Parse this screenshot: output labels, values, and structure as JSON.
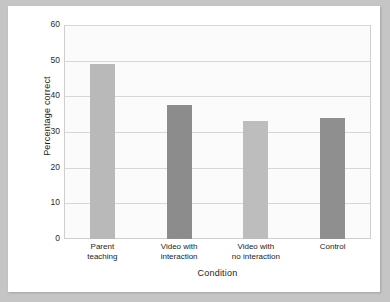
{
  "chart_data": {
    "type": "bar",
    "title": "",
    "xlabel": "Condition",
    "ylabel": "Percentage correct",
    "categories": [
      "Parent teaching",
      "Video with interaction",
      "Video with no interaction",
      "Control"
    ],
    "category_lines": [
      [
        "Parent",
        "teaching"
      ],
      [
        "Video with",
        "interaction"
      ],
      [
        "Video with",
        "no interaction"
      ],
      [
        "Control",
        ""
      ]
    ],
    "values": [
      49,
      37.5,
      33,
      34
    ],
    "ylim": [
      0,
      60
    ],
    "yticks": [
      0,
      10,
      20,
      30,
      40,
      50,
      60
    ],
    "ytick_labels": [
      "0",
      "10",
      "20",
      "30",
      "40",
      "50",
      "60"
    ],
    "grid": true,
    "legend": "none",
    "bar_colors": [
      "#b9b9b9",
      "#8c8c8c",
      "#bdbdbd",
      "#8f8f8f"
    ]
  },
  "figure": {
    "page_background": "#c5c5c5",
    "card_background": "#ffffff",
    "plot_background": "#fbfbfb",
    "gridline_color": "#d7d7d7",
    "frame_color": "#cfcfcf",
    "text_color": "#1c1c1c"
  }
}
